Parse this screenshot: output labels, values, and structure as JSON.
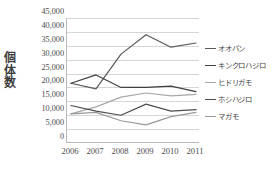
{
  "chart_data": {
    "type": "line",
    "title": "",
    "xlabel": "",
    "ylabel": "個体数",
    "categories": [
      "2006",
      "2007",
      "2008",
      "2009",
      "2010",
      "2011"
    ],
    "ylim": [
      0,
      45000
    ],
    "ytick_step": 5000,
    "yticks": [
      "0",
      "5,000",
      "10,000",
      "15,000",
      "20,000",
      "25,000",
      "30,000",
      "35,000",
      "40,000",
      "45,000"
    ],
    "ytick_values": [
      0,
      5000,
      10000,
      15000,
      20000,
      25000,
      30000,
      35000,
      40000,
      45000
    ],
    "grid": true,
    "legend_position": "right",
    "series": [
      {
        "name": "オオバン",
        "color": "#595959",
        "values": [
          21500,
          19500,
          32000,
          39000,
          34500,
          36000
        ]
      },
      {
        "name": "キンクロハジロ",
        "color": "#404040",
        "values": [
          21500,
          24500,
          20000,
          20000,
          20500,
          18500
        ]
      },
      {
        "name": "ヒドリガモ",
        "color": "#a6a6a6",
        "values": [
          10500,
          13000,
          16500,
          18000,
          17000,
          17500
        ]
      },
      {
        "name": "ホシハジロ",
        "color": "#4d4d4d",
        "values": [
          13500,
          11500,
          10000,
          14000,
          11500,
          12000
        ]
      },
      {
        "name": "マガモ",
        "color": "#999999",
        "values": [
          10500,
          11000,
          8000,
          6500,
          9500,
          11000
        ]
      }
    ]
  }
}
